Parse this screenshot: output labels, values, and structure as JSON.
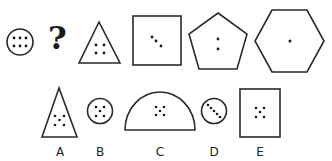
{
  "puzzle": {
    "sequence": [
      {
        "shape": "circle",
        "dots": 6,
        "pattern": "2x3 grid"
      },
      {
        "shape": "unknown",
        "symbol": "?"
      },
      {
        "shape": "triangle",
        "dots": 4,
        "pattern": "2x2 grid"
      },
      {
        "shape": "square",
        "dots": 3,
        "pattern": "diagonal line"
      },
      {
        "shape": "pentagon",
        "dots": 2,
        "pattern": "vertical pair"
      },
      {
        "shape": "hexagon",
        "dots": 1,
        "pattern": "center"
      }
    ],
    "question_mark": "?",
    "options": [
      {
        "label": "A",
        "shape": "triangle",
        "dots": 5,
        "pattern": "X"
      },
      {
        "label": "B",
        "shape": "circle",
        "dots": 5,
        "pattern": "X"
      },
      {
        "label": "C",
        "shape": "semicircle",
        "dots": 5,
        "pattern": "X"
      },
      {
        "label": "D",
        "shape": "circle",
        "dots": 5,
        "pattern": "diagonal line"
      },
      {
        "label": "E",
        "shape": "square",
        "dots": 5,
        "pattern": "X"
      }
    ]
  },
  "colors": {
    "stroke": "#2a2a2a",
    "dot": "#1a1a1a",
    "background": "#ffffff"
  }
}
